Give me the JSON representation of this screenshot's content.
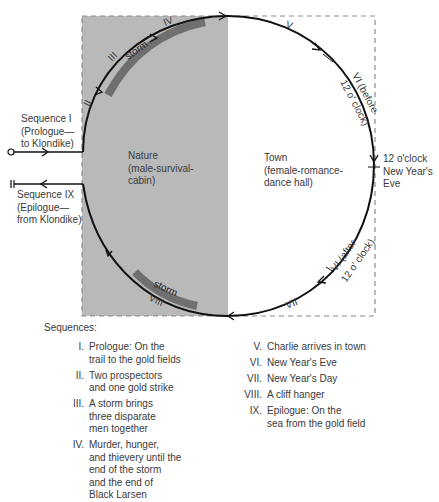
{
  "diagram": {
    "colors": {
      "nature_fill": "#b9b9b9",
      "storm_band": "#6f6f6f",
      "loop_line": "#111111",
      "box_dash": "#8a8a8a",
      "text": "#3a3a3a"
    },
    "regions": {
      "nature": "Nature\n(male-survival-\ncabin)",
      "town": "Town\n(female-romance-\ndance hall)"
    },
    "entry_label": "Sequence I\n(Prologue—\nto Klondike)",
    "exit_label": "Sequence IX\n(Epilogue—\nfrom Klondike)",
    "midnight_label": "12 o'clock\nNew Year's\nEve",
    "arc_labels": {
      "ii": "II",
      "iii": "III",
      "iv": "IV",
      "v": "V",
      "vi_before": "VI (before",
      "vi_before_2": "12 o' clock)",
      "vi_after": "VI (after",
      "vi_after_2": "12 o' clock)",
      "vii": "VII",
      "viii": "VIII",
      "storm_top": "storm",
      "storm_bottom": "storm"
    }
  },
  "legend": {
    "heading": "Sequences:",
    "left": [
      {
        "num": "I.",
        "text": "Prologue:  On the\ntrail to the gold fields"
      },
      {
        "num": "II.",
        "text": "Two prospectors\nand one gold strike"
      },
      {
        "num": "III.",
        "text": "A storm brings\nthree disparate\nmen together"
      },
      {
        "num": "IV.",
        "text": "Murder, hunger,\nand thievery until the\nend of the storm\nand the end of\nBlack Larsen"
      }
    ],
    "right": [
      {
        "num": "V.",
        "text": "Charlie arrives in town"
      },
      {
        "num": "VI.",
        "text": "New Year's Eve"
      },
      {
        "num": "VII.",
        "text": "New Year's Day"
      },
      {
        "num": "VIII.",
        "text": "A cliff hanger"
      },
      {
        "num": "IX.",
        "text": "Epilogue:  On the\nsea from the gold field"
      }
    ]
  }
}
